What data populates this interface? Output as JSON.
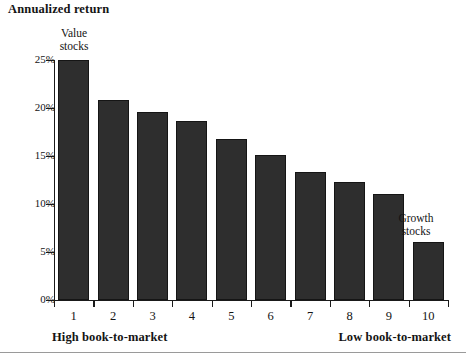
{
  "chart_data": {
    "type": "bar",
    "title": "Annualized return",
    "xlabel": "",
    "ylabel": "Annualized return",
    "categories": [
      "1",
      "2",
      "3",
      "4",
      "5",
      "6",
      "7",
      "8",
      "9",
      "10"
    ],
    "values": [
      25.0,
      20.8,
      19.6,
      18.6,
      16.8,
      15.1,
      13.3,
      12.3,
      11.0,
      6.0
    ],
    "ylim": [
      0,
      25
    ],
    "ytick_labels": [
      "0%",
      "5%",
      "10%",
      "15%",
      "20%",
      "25%"
    ],
    "ytick_values": [
      0,
      5,
      10,
      15,
      20,
      25
    ],
    "grid": false,
    "legend": "none",
    "bar_color": "#2e2e2e",
    "axis_color": "#1a1a1a",
    "annotations": [
      {
        "text_line1": "Value",
        "text_line2": "stocks",
        "at_category": "1"
      },
      {
        "text_line1": "Growth",
        "text_line2": "stocks",
        "at_category": "10"
      }
    ],
    "x_captions": {
      "left": "High book-to-market",
      "right": "Low book-to-market"
    }
  },
  "figure": {
    "title": "Annualized return",
    "annotation_value_line1": "Value",
    "annotation_value_line2": "stocks",
    "annotation_growth_line1": "Growth",
    "annotation_growth_line2": "stocks",
    "caption_left": "High book-to-market",
    "caption_right": "Low book-to-market"
  }
}
